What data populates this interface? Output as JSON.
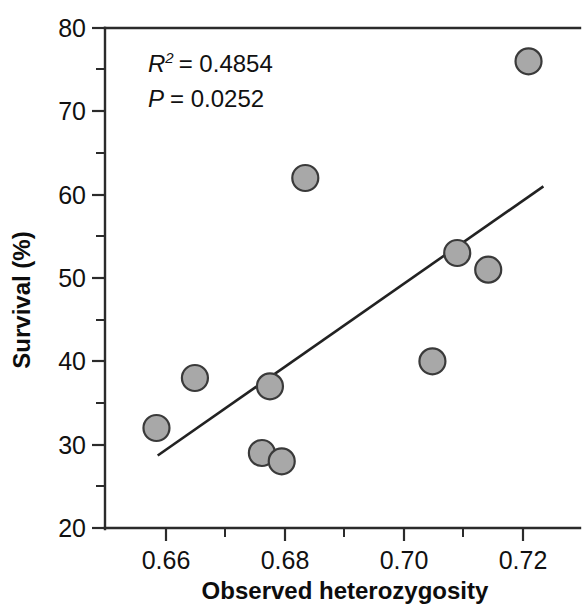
{
  "chart_data": {
    "type": "scatter",
    "title": "",
    "xlabel": "Observed heterozygosity",
    "ylabel": "Survival (%)",
    "xlim": [
      0.6517,
      0.7283
    ],
    "ylim": [
      20,
      80
    ],
    "grid": false,
    "legend": null,
    "x_ticks_major": [
      "0.66",
      "0.68",
      "0.70",
      "0.72"
    ],
    "x_ticks_major_values": [
      0.66,
      0.68,
      0.7,
      0.72
    ],
    "x_ticks_minor_values": [
      0.67,
      0.69,
      0.71
    ],
    "y_ticks_major": [
      "20",
      "30",
      "40",
      "50",
      "60",
      "70",
      "80"
    ],
    "y_ticks_major_values": [
      20,
      30,
      40,
      50,
      60,
      70,
      80
    ],
    "y_ticks_minor_values": [
      25,
      35,
      45,
      55,
      65,
      75
    ],
    "points": [
      {
        "x": 0.66,
        "y": 32
      },
      {
        "x": 0.6662,
        "y": 38
      },
      {
        "x": 0.677,
        "y": 29
      },
      {
        "x": 0.6783,
        "y": 37
      },
      {
        "x": 0.6802,
        "y": 28
      },
      {
        "x": 0.684,
        "y": 62
      },
      {
        "x": 0.7045,
        "y": 40
      },
      {
        "x": 0.7085,
        "y": 53
      },
      {
        "x": 0.7135,
        "y": 51
      },
      {
        "x": 0.72,
        "y": 76
      }
    ],
    "marker": {
      "shape": "circle",
      "radius_px": 13,
      "fill_color": "#a8a8a8",
      "edge_color": "#3a3a3a"
    },
    "trendline": {
      "type": "linear-regression",
      "x_start": 0.6602,
      "y_start": 28.7,
      "x_end": 0.7224,
      "y_end": 61.0,
      "color": "#222222"
    },
    "annotations": {
      "r_squared_var": "R",
      "r_squared_exponent": "2",
      "r_squared_value": "= 0.4854",
      "r_squared_full": "R2 = 0.4854",
      "p_var": "P",
      "p_value": "= 0.0252",
      "p_full": "P = 0.0252"
    }
  }
}
